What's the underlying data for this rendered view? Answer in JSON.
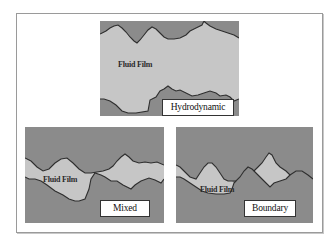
{
  "diagram": {
    "colors": {
      "surface": "#8b8b8b",
      "fluid_film": "#c6c6c6",
      "outline": "#2e2e2e",
      "label_bg": "#ffffff",
      "frame_border": "#9a9a9a"
    },
    "panels": [
      {
        "id": "hydrodynamic",
        "regime_label": "Hydrodynamic",
        "film_label": "Fluid Film",
        "description": "Surfaces fully separated by a thick fluid film"
      },
      {
        "id": "mixed",
        "regime_label": "Mixed",
        "film_label": "Fluid Film",
        "description": "Thin fluid film with occasional asperity contact"
      },
      {
        "id": "boundary",
        "regime_label": "Boundary",
        "film_label": "Fluid Film",
        "description": "Surfaces in contact, fluid trapped in isolated pockets"
      }
    ]
  }
}
